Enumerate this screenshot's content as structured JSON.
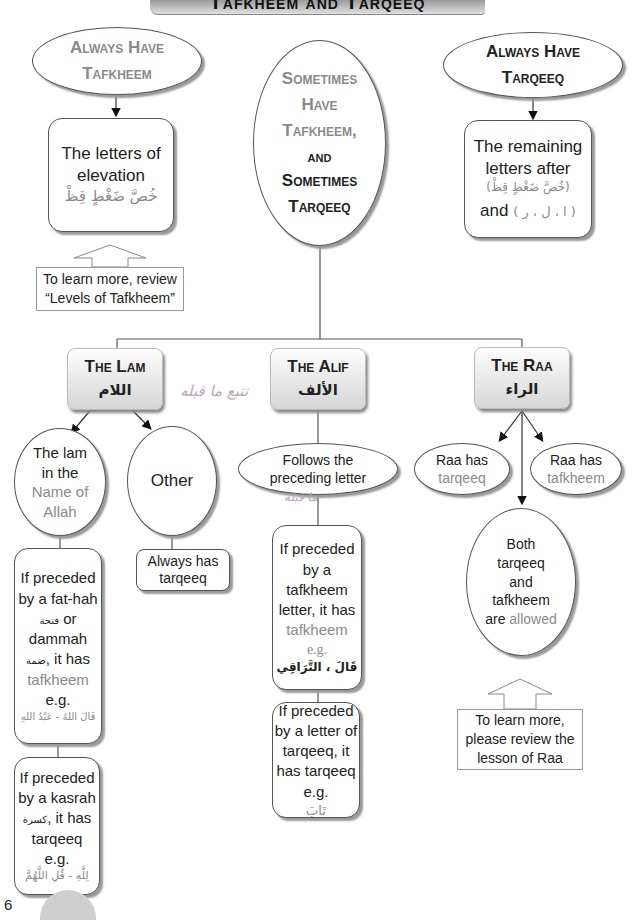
{
  "header": {
    "title": "Tafkheem and Tarqeeq"
  },
  "top_level": {
    "always_tafkheem": {
      "title_line1": "Always Have",
      "title_line2": "Tafkheem",
      "box_line1": "The letters of",
      "box_line2": "elevation",
      "box_arabic": "خُصَّ ضَغْطٍ قِظْ",
      "note_line1": "To learn more, review",
      "note_line2": "“Levels of Tafkheem”"
    },
    "sometimes": {
      "line1": "Sometimes",
      "line2": "Have",
      "line3": "Tafkheem,",
      "line4": "and",
      "line5": "Sometimes",
      "line6": "Tarqeeq"
    },
    "always_tarqeeq": {
      "title_line1": "Always Have",
      "title_line2": "Tarqeeq",
      "box_line1": "The remaining",
      "box_line2": "letters after",
      "box_arabic": "(خُصَّ ضَغْطٍ قِظْ)",
      "box_and": "and",
      "box_arabic2": "( ا ، ل ، ر )"
    }
  },
  "categories": {
    "lam": {
      "title": "The Lam",
      "arabic": "اللام",
      "name_of_allah": {
        "line1": "The lam",
        "line2": "in the",
        "line3": "Name of",
        "line4": "Allah"
      },
      "other": {
        "label": "Other",
        "box_line1": "Always has",
        "box_line2": "tarqeeq"
      },
      "fathah_rule": {
        "line1": "If preceded",
        "line2": "by a fat-hah",
        "arabic_fathah": "فتحة",
        "or": "or",
        "line3": "dammah",
        "arabic_dammah": "ضمة",
        "it_has": ", it has",
        "result": "tafkheem",
        "eg": "e.g.",
        "example": "قَالَ اللهُ - عَبْدُ اللهِ"
      },
      "kasrah_rule": {
        "line1": "If preceded",
        "line2": "by a kasrah",
        "arabic_kasrah": "كسرة",
        "it_has": ", it has",
        "result": "tarqeeq",
        "eg": "e.g.",
        "example": "لِلَّهِ - قُلِ اللَّهُمَّ"
      }
    },
    "alif": {
      "title": "The Alif",
      "arabic": "الألف",
      "follows_line1": "Follows the",
      "follows_line2": "preceding letter",
      "tafkheem_rule": {
        "line1": "If preceded",
        "line2": "by a",
        "line3": "tafkheem",
        "line4": "letter, it has",
        "result": "tafkheem",
        "eg": "e.g.",
        "example": "قَالَ ، التَّرَاقِي"
      },
      "tarqeeq_rule": {
        "line1": "If preceded",
        "line2": "by a letter of",
        "line3": "tarqeeq, it",
        "line4": "has tarqeeq",
        "eg": "e.g.",
        "example": "تَابَ"
      }
    },
    "raa": {
      "title": "The Raa",
      "arabic": "الراء",
      "has_tarqeeq": {
        "line1": "Raa has",
        "line2": "tarqeeq"
      },
      "has_tafkheem": {
        "line1": "Raa has",
        "line2": "tafkheem"
      },
      "both": {
        "line1": "Both",
        "line2": "tarqeeq",
        "line3": "and",
        "line4": "tafkheem",
        "line5a": "are",
        "line5b": "allowed"
      },
      "note_line1": "To learn more,",
      "note_line2": "please review the",
      "note_line3": "lesson of Raa"
    }
  },
  "handwriting": {
    "note1": "تتبع ما قبله",
    "note2": "ما قبله"
  },
  "footer": {
    "page_number": "6"
  },
  "colors": {
    "accent_grey": "#8a8a8a",
    "text": "#222222",
    "border": "#555555"
  }
}
